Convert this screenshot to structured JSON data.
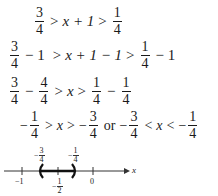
{
  "steps": [
    {
      "left": {
        "num": "3",
        "den": "4"
      },
      "op1": ">",
      "middle": "x + 1",
      "op2": ">",
      "right": {
        "num": "1",
        "den": "4"
      }
    },
    {
      "left": {
        "num": "3",
        "den": "4"
      },
      "left_suffix": "− 1",
      "op1": ">",
      "middle": "x + 1 − 1",
      "op2": ">",
      "right": {
        "num": "1",
        "den": "4"
      },
      "right_suffix": "− 1"
    },
    {
      "left": {
        "num": "3",
        "den": "4"
      },
      "left_mid": "−",
      "left2": {
        "num": "4",
        "den": "4"
      },
      "op1": ">",
      "middle": "x",
      "op2": ">",
      "right": {
        "num": "1",
        "den": "4"
      },
      "right_mid": "−",
      "right2": {
        "num": "1",
        "den": "4"
      }
    },
    {
      "left_sign": "−",
      "left": {
        "num": "1",
        "den": "4"
      },
      "op1": ">",
      "middle": "x",
      "op2": ">",
      "right_sign": "−",
      "right": {
        "num": "3",
        "den": "4"
      },
      "connector": "or",
      "alt_left_sign": "−",
      "alt_left": {
        "num": "3",
        "den": "4"
      },
      "alt_op1": "<",
      "alt_middle": "x",
      "alt_op2": "<",
      "alt_right_sign": "−",
      "alt_right": {
        "num": "1",
        "den": "4"
      }
    }
  ],
  "number_line": {
    "axis_label": "x",
    "ticks": [
      {
        "label": "−1",
        "value": -1
      },
      {
        "label_sign": "−",
        "num": "1",
        "den": "2",
        "value": -0.5
      },
      {
        "label": "0",
        "value": 0
      }
    ],
    "endpoints": [
      {
        "label_sign": "−",
        "num": "3",
        "den": "4",
        "value": -0.75,
        "type": "open",
        "glyph": "("
      },
      {
        "label_sign": "−",
        "num": "1",
        "den": "4",
        "value": -0.25,
        "type": "open",
        "glyph": ")"
      }
    ]
  }
}
